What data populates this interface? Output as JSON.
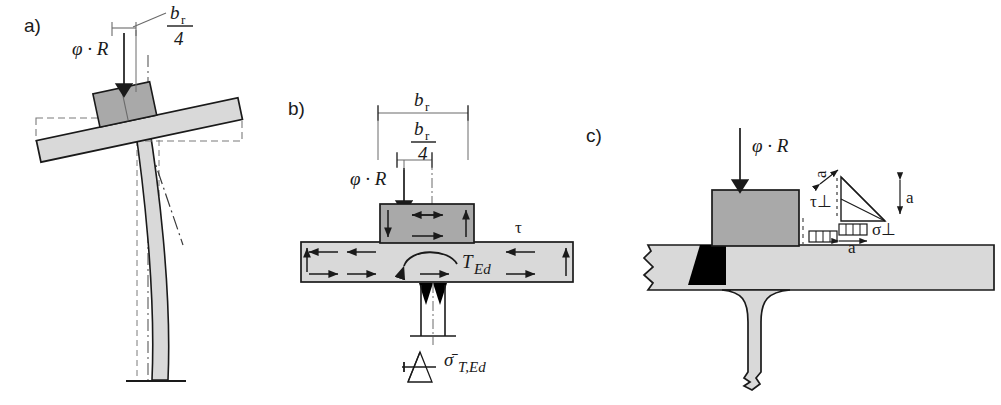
{
  "figure": {
    "panels": [
      {
        "key": "a",
        "label": "a)",
        "caption": "Tilted bearing plate on laterally buckled column"
      },
      {
        "key": "b",
        "label": "b)",
        "caption": "Eccentric load producing torsion in the plate"
      },
      {
        "key": "c",
        "label": "c)",
        "caption": "Fillet weld throat stresses at the block"
      }
    ]
  },
  "panel_a": {
    "label": "a)",
    "load_label": "φ · R",
    "dimension_label_num": "b",
    "dimension_label_sub": "r",
    "dimension_label_den": "4",
    "notes": "dashed outline = undeformed position; dash-dot line = original column axis"
  },
  "panel_b": {
    "label": "b)",
    "load_label": "φ · R",
    "width_label_num": "b",
    "width_label_sub": "r",
    "quarter_label_num": "b",
    "quarter_label_sub": "r",
    "quarter_label_den": "4",
    "shear_label": "τ",
    "torsion_label": "T",
    "torsion_sub": "Ed",
    "stress_label": "σ",
    "stress_sub": "T,Ed",
    "stress_label_overbar": "σ̄"
  },
  "panel_c": {
    "label": "c)",
    "load_label": "φ · R",
    "throat_label": "a",
    "throat_label_vertical": "a",
    "throat_label_bottom": "a",
    "shear_perp_label": "τ⊥",
    "normal_perp_label": "σ⊥"
  },
  "colors": {
    "plate_fill": "#d9d9d9",
    "block_fill": "#a9a9a9",
    "weld_fill": "#000000",
    "line": "#1a1a1a",
    "text": "#1a1a1a",
    "background": "#ffffff"
  }
}
